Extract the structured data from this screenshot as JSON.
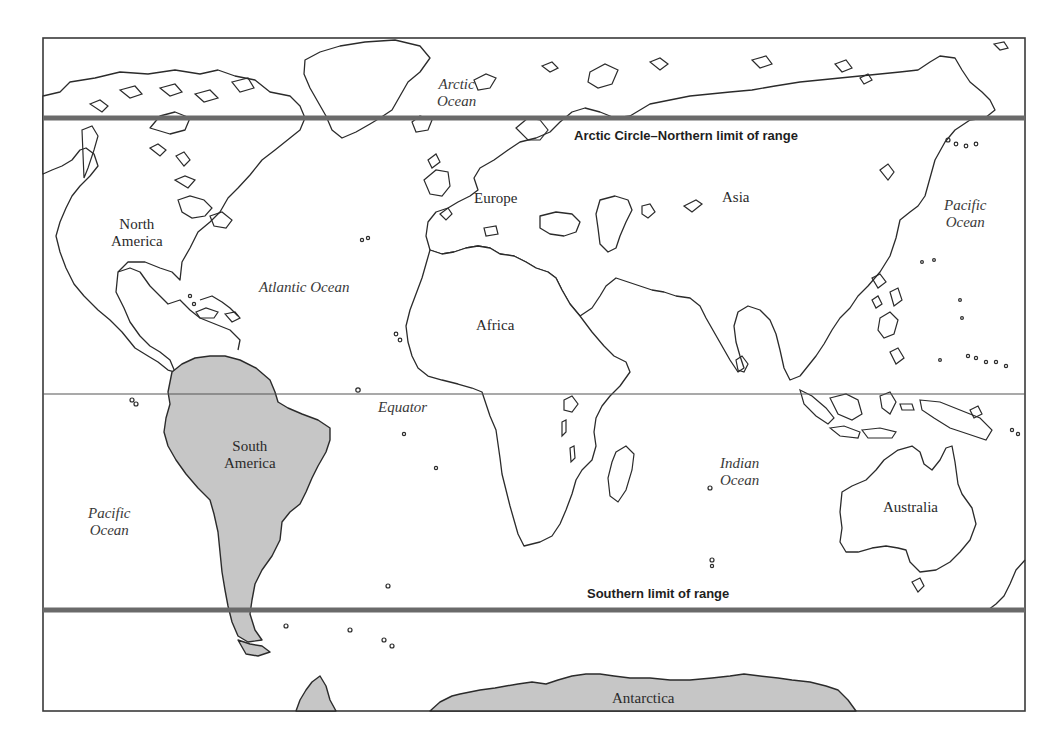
{
  "map": {
    "frame": {
      "x": 43,
      "y": 38,
      "width": 982,
      "height": 673
    },
    "colors": {
      "shaded_land": "#c6c6c6",
      "range_line": "#6a6a6a",
      "coastline": "#2b2b2b",
      "equator_line": "#555555",
      "background": "#ffffff"
    },
    "lines": {
      "northern_limit": {
        "label": "Arctic Circle–Northern limit of range",
        "y": 118
      },
      "equator": {
        "label": "Equator",
        "y": 394
      },
      "southern_limit": {
        "label": "Southern limit of range",
        "y": 610
      }
    },
    "continents": [
      {
        "id": "north-america",
        "label": "North America",
        "line1": "North",
        "line2": "America",
        "shaded": false
      },
      {
        "id": "south-america",
        "label": "South America",
        "line1": "South",
        "line2": "America",
        "shaded": true
      },
      {
        "id": "europe",
        "label": "Europe",
        "shaded": false
      },
      {
        "id": "asia",
        "label": "Asia",
        "shaded": false
      },
      {
        "id": "africa",
        "label": "Africa",
        "shaded": false
      },
      {
        "id": "australia",
        "label": "Australia",
        "shaded": false
      },
      {
        "id": "antarctica",
        "label": "Antarctica",
        "shaded": true
      }
    ],
    "oceans": [
      {
        "id": "arctic-ocean",
        "line1": "Arctic",
        "line2": "Ocean"
      },
      {
        "id": "atlantic-ocean",
        "line1": "Atlantic Ocean"
      },
      {
        "id": "pacific-ocean-east",
        "line1": "Pacific",
        "line2": "Ocean"
      },
      {
        "id": "pacific-ocean-west",
        "line1": "Pacific",
        "line2": "Ocean"
      },
      {
        "id": "indian-ocean",
        "line1": "Indian",
        "line2": "Ocean"
      }
    ]
  }
}
